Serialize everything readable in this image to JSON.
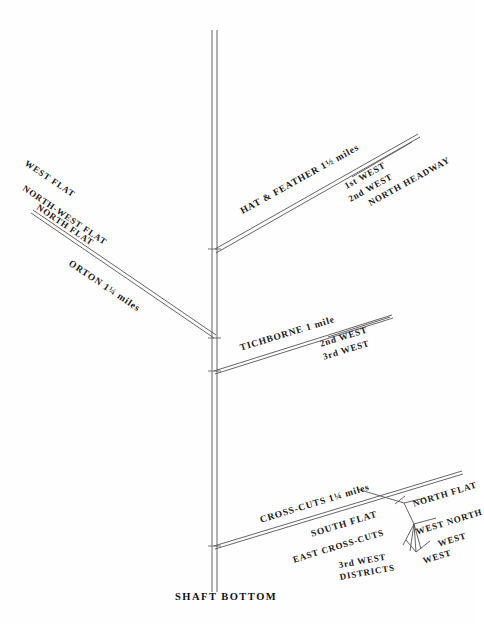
{
  "figure": {
    "background_color": "#fefefe",
    "line_color": "#555555",
    "text_color": "#1a1a1a"
  },
  "shaft": {
    "bottom_label": "SHAFT BOTTOM"
  },
  "branches": {
    "orton": {
      "headings": [
        {
          "label": "WEST FLAT"
        },
        {
          "label": "NORTH-WEST FLAT"
        },
        {
          "label": "NORTH FLAT"
        }
      ],
      "name_label": "ORTON 1¼ miles"
    },
    "hat_and_feather": {
      "name_label": "HAT & FEATHER 1½ miles",
      "headings": [
        {
          "label": "1st WEST"
        },
        {
          "label": "2nd WEST"
        },
        {
          "label": "NORTH HEADWAY"
        }
      ]
    },
    "tichborne": {
      "name_label": "TICHBORNE 1 mile",
      "headings": [
        {
          "label": "2nd WEST"
        },
        {
          "label": "3rd WEST"
        }
      ]
    },
    "cross_cuts": {
      "name_label": "CROSS-CUTS 1¼ miles",
      "headings": [
        {
          "label": "SOUTH FLAT"
        },
        {
          "label": "EAST CROSS-CUTS"
        },
        {
          "label": "NORTH FLAT"
        },
        {
          "label": "WEST NORTH"
        },
        {
          "label": "WEST"
        },
        {
          "label": "WEST"
        },
        {
          "label": "3rd WEST"
        },
        {
          "label": "DISTRICTS"
        }
      ]
    }
  }
}
